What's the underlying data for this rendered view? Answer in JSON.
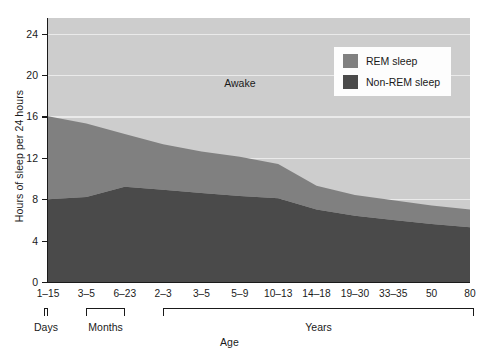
{
  "chart_data": {
    "type": "area",
    "stacked": true,
    "title": "",
    "xlabel": "Age",
    "ylabel": "Hours of sleep per 24 hours",
    "ylim": [
      0,
      25.5
    ],
    "yticks": [
      0,
      4,
      8,
      12,
      16,
      20,
      24
    ],
    "grid": true,
    "legend_position": "top-right",
    "categories": [
      "1–15",
      "3–5",
      "6–23",
      "2–3",
      "3–5",
      "5–9",
      "10–13",
      "14–18",
      "19–30",
      "33–35",
      "50",
      "80"
    ],
    "category_groups": [
      {
        "label": "Days",
        "from": 0,
        "to": 0
      },
      {
        "label": "Months",
        "from": 1,
        "to": 2
      },
      {
        "label": "Years",
        "from": 3,
        "to": 11
      }
    ],
    "series": [
      {
        "name": "Non-REM sleep",
        "color": "#4a4a4a",
        "values": [
          8.0,
          8.2,
          9.2,
          8.9,
          8.6,
          8.3,
          8.1,
          7.0,
          6.4,
          6.0,
          5.6,
          5.3
        ]
      },
      {
        "name": "REM sleep",
        "color": "#808080",
        "values": [
          8.0,
          7.1,
          5.1,
          4.4,
          4.0,
          3.8,
          3.3,
          2.3,
          2.0,
          1.9,
          1.8,
          1.7
        ]
      },
      {
        "name": "Awake",
        "color": "#cdcdcd",
        "values": [
          9.5,
          10.2,
          11.2,
          12.2,
          12.9,
          13.4,
          14.1,
          16.2,
          17.1,
          17.6,
          18.1,
          18.5
        ]
      }
    ],
    "cumulative_nonrem_top": [
      8.0,
      8.2,
      9.2,
      8.9,
      8.6,
      8.3,
      8.1,
      7.0,
      6.4,
      6.0,
      5.6,
      5.3
    ],
    "cumulative_rem_top": [
      16.0,
      15.3,
      14.3,
      13.3,
      12.6,
      12.1,
      11.4,
      9.3,
      8.4,
      7.9,
      7.4,
      7.0
    ],
    "annotations": [
      {
        "text": "Awake",
        "x_category_index": 5.0,
        "y_value": 19.2
      }
    ]
  },
  "axes": {
    "y_title": "Hours of sleep per 24 hours",
    "x_title": "Age",
    "y_tick_labels": [
      "0",
      "4",
      "8",
      "12",
      "16",
      "20",
      "24"
    ],
    "x_tick_labels": [
      "1–15",
      "3–5",
      "6–23",
      "2–3",
      "3–5",
      "5–9",
      "10–13",
      "14–18",
      "19–30",
      "33–35",
      "50",
      "80"
    ]
  },
  "groups": {
    "days_label": "Days",
    "months_label": "Months",
    "years_label": "Years"
  },
  "legend": {
    "items": [
      {
        "label": "REM sleep",
        "color": "#808080"
      },
      {
        "label": "Non-REM sleep",
        "color": "#4a4a4a"
      }
    ]
  },
  "plot_labels": {
    "awake": "Awake"
  },
  "colors": {
    "awake": "#cdcdcd",
    "rem": "#808080",
    "nonrem": "#4a4a4a",
    "gridline": "#efefef",
    "axis": "#1a1a1a",
    "legend_background": "#fdfdfd",
    "page_background": "#ffffff"
  }
}
